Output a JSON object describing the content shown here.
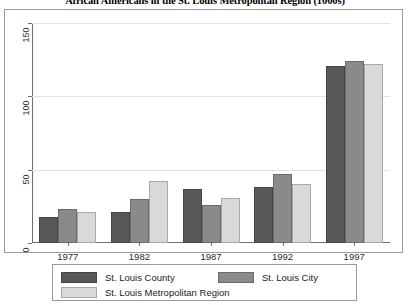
{
  "chart_data": {
    "type": "bar",
    "title": "African Americans in the St. Louis Metropolitan Region (1000s)",
    "xlabel": "",
    "ylabel": "",
    "categories": [
      "1977",
      "1982",
      "1987",
      "1992",
      "1997"
    ],
    "series": [
      {
        "name": "St. Louis County",
        "color": "#585858",
        "values": [
          18,
          21,
          37,
          38,
          121
        ]
      },
      {
        "name": "St. Louis City",
        "color": "#8a8a8a",
        "values": [
          23,
          30,
          26,
          47,
          124
        ]
      },
      {
        "name": "St. Louis Metropolitan Region",
        "color": "#d9d9d9",
        "values": [
          21,
          42,
          31,
          40,
          122
        ]
      }
    ],
    "ylim": [
      0,
      150
    ],
    "yticks": [
      "0",
      "50",
      "100",
      "150"
    ],
    "ytick_values": [
      0,
      50,
      100,
      150
    ],
    "grid": true,
    "legend_position": "bottom"
  },
  "axis": {
    "y_tick_0": "0",
    "y_tick_1": "50",
    "y_tick_2": "100",
    "y_tick_3": "150"
  },
  "legend": {
    "entry_county": "St. Louis County",
    "entry_city": "St. Louis City",
    "entry_metro": "St. Louis Metropolitan Region"
  }
}
